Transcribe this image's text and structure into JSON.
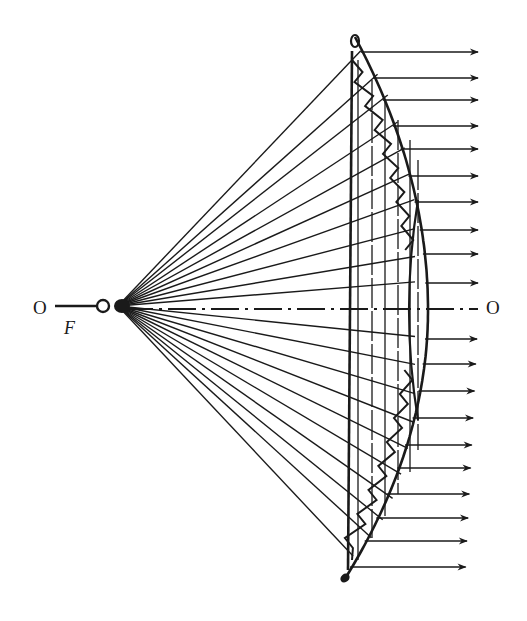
{
  "diagram": {
    "title": "",
    "labels": {
      "axis_left": "O",
      "axis_right": "O",
      "focus": "F"
    },
    "colors": {
      "ink": "#1a1a1a",
      "background": "#ffffff"
    },
    "focal_point": {
      "x": 118,
      "y": 306
    },
    "source_circle": {
      "cx": 103,
      "cy": 306,
      "r": 6
    },
    "axis": {
      "y": 309,
      "x_start": 55,
      "x_end": 478
    },
    "lens": {
      "flat_face_x": 352,
      "top_tip": {
        "x": 355,
        "y": 37
      },
      "bottom_tip": {
        "x": 343,
        "y": 582
      },
      "apex": {
        "x": 428,
        "y": 310
      }
    },
    "rays_upper_hit_y": [
      60,
      97,
      123,
      152,
      177,
      200,
      222,
      245,
      267,
      287
    ],
    "rays_lower_hit_y": [
      330,
      352,
      375,
      398,
      421,
      445,
      470,
      495,
      520,
      555
    ],
    "outgoing_arrows_y": [
      52,
      78,
      100,
      126,
      149,
      176,
      202,
      230,
      254,
      283,
      339,
      364,
      391,
      418,
      445,
      468,
      494,
      518,
      541,
      567
    ],
    "arrow_tip_x": 478,
    "inner_verticals_x": [
      358,
      372,
      385,
      398,
      410,
      418
    ]
  }
}
